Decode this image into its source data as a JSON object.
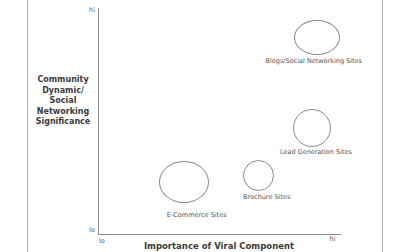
{
  "page": {
    "background": "#ffffff",
    "border_color": "#b3b3b3"
  },
  "chart_data": {
    "type": "scatter",
    "variant": "bubble",
    "title": "",
    "xlabel": "Importance of Viral Component",
    "ylabel": "Community Dynamic/ Social Networking Significance",
    "ylabel_lines": [
      "Community",
      "Dynamic/",
      "Social",
      "Networking",
      "Significance"
    ],
    "axis_ticks": {
      "y_hi": "hi",
      "y_lo": "lo",
      "x_lo": "lo",
      "x_hi": "hi"
    },
    "xlim": [
      "lo",
      "hi"
    ],
    "ylim": [
      "lo",
      "hi"
    ],
    "grid": false,
    "legend": false,
    "colors": {
      "axis": "#8a8a8a",
      "bubble_stroke": "#8a8a8a",
      "title_text": "#3b3b3b",
      "label_text": "#555555"
    },
    "points": [
      {
        "label": "Blogs/Social Networking Sites",
        "x": 0.9,
        "y": 0.87,
        "rx": 23,
        "ry": 17.5,
        "label_dx": -3,
        "label_gap": 3
      },
      {
        "label": "Lead Generation Sites",
        "x": 0.88,
        "y": 0.47,
        "rx": 19,
        "ry": 19,
        "label_dx": 4,
        "label_gap": 2
      },
      {
        "label": "Brochure Sites",
        "x": 0.66,
        "y": 0.26,
        "rx": 15.5,
        "ry": 15.5,
        "label_dx": 8,
        "label_gap": 3
      },
      {
        "label": "E-Commerce Sites",
        "x": 0.35,
        "y": 0.23,
        "rx": 25,
        "ry": 21,
        "label_dx": 13,
        "label_gap": 9
      }
    ]
  }
}
